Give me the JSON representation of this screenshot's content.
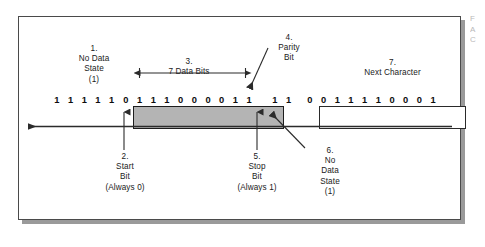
{
  "figure": {
    "edge_caption_lines": [
      "F",
      "A",
      "C"
    ]
  },
  "colors": {
    "frame_fill": "#b4b4b4",
    "frame_stroke": "#1d1d1d",
    "panel_border": "#4a4a4a",
    "panel_shadow": "#9a9a9a",
    "line": "#2b2b2b",
    "text": "#1a1a1a",
    "background": "#ffffff"
  },
  "callouts": {
    "no_data_state_left": {
      "number": "1.",
      "line1": "No Data",
      "line2": "State",
      "line3": "(1)"
    },
    "data_bits": {
      "number": "3.",
      "line1": "7 Data Bits"
    },
    "parity_bit": {
      "number": "4.",
      "line1": "Parity",
      "line2": "Bit"
    },
    "next_character": {
      "number": "7.",
      "line1": "Next Character"
    },
    "start_bit": {
      "number": "2.",
      "line1": "Start",
      "line2": "Bit",
      "line3": "(Always 0)"
    },
    "stop_bit": {
      "number": "5.",
      "line1": "Stop",
      "line2": "Bit",
      "line3": "(Always 1)"
    },
    "no_data_state_right": {
      "number": "6.",
      "line1": "No",
      "line2": "Data",
      "line3": "State",
      "line4": "(1)"
    }
  },
  "bitstream": {
    "idle_before": [
      "1",
      "1",
      "1",
      "1",
      "1"
    ],
    "framed_character": [
      "0",
      "1",
      "1",
      "1",
      "0",
      "0",
      "0",
      "0",
      "1",
      "1"
    ],
    "idle_between": [
      "1",
      "1"
    ],
    "next_character": [
      "0",
      "0",
      "1",
      "1",
      "1",
      "1",
      "0",
      "0",
      "0",
      "1"
    ]
  },
  "direction_arrow": {
    "label": "time-flow-left",
    "points_to": "left"
  }
}
